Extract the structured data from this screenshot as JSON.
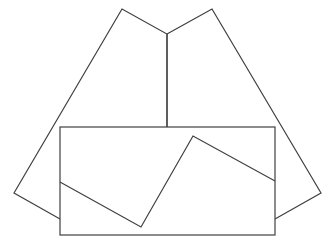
{
  "diagram": {
    "width": 331,
    "height": 247,
    "background": "#ffffff",
    "stroke": "#404040",
    "stroke_width": 1.2,
    "shapes": [
      {
        "id": "left-panel",
        "type": "polyline",
        "points": [
          [
            167,
            127
          ],
          [
            167,
            34
          ],
          [
            122,
            9
          ],
          [
            14,
            193
          ],
          [
            60,
            219
          ]
        ]
      },
      {
        "id": "right-panel",
        "type": "polyline",
        "points": [
          [
            167,
            34
          ],
          [
            212,
            9
          ],
          [
            321,
            193
          ],
          [
            275,
            219
          ]
        ]
      },
      {
        "id": "center-fold",
        "type": "line",
        "points": [
          [
            167,
            34
          ],
          [
            167,
            127
          ]
        ]
      },
      {
        "id": "front-rectangle",
        "type": "rect",
        "x": 60,
        "y": 127,
        "w": 215,
        "h": 108
      },
      {
        "id": "inner-zigzag",
        "type": "polyline",
        "points": [
          [
            60,
            182
          ],
          [
            141,
            227
          ],
          [
            193,
            136
          ],
          [
            275,
            181
          ]
        ]
      }
    ]
  }
}
